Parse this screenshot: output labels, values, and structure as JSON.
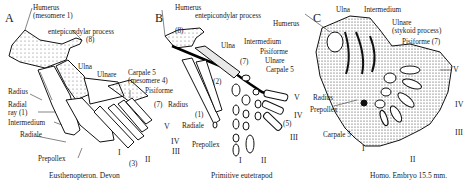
{
  "panels": [
    {
      "letter": "A",
      "caption": "Eusthenopteron. Devon",
      "labels": {
        "humerus": "Humerus",
        "humerus_sub": "(mesomere 1)",
        "entepicondylar": "entepicondylar process",
        "entepicondylar_num": "(8)",
        "ulna": "Ulna",
        "ulnare": "Ulnare",
        "carpale5": "Carpale 5",
        "carpale5_sub": "(mesomere 4)",
        "pisiforme": "Pisiforme",
        "pisiforme_num": "(7)",
        "radius": "Radius",
        "radial_ray": "Radial",
        "radial_ray2": "ray (1)",
        "intermedium": "Intermedium",
        "radiale": "Radiale",
        "prepollex": "Prepollex",
        "digits": [
          "I",
          "II",
          "III",
          "IV",
          "V"
        ],
        "num3": "(3)"
      }
    },
    {
      "letter": "B",
      "caption": "Primitive eutetrapod",
      "labels": {
        "humerus": "Humerus",
        "entepicondylar": "entepicondylar process",
        "entepicondylar_num": "(8)",
        "ulna": "Ulna",
        "intermedium": "Intermedium",
        "pisiforme": "Pisiforme",
        "pisiforme_num": "(7)",
        "ulnare": "Ulnare",
        "carpale5": "Carpale 5",
        "num2": "(2)",
        "radius": "Radius",
        "num1": "(1)",
        "radiale": "Radiale",
        "prepollex": "Prepollex",
        "num5": "(5)",
        "digits": [
          "I",
          "II",
          "III",
          "IV",
          "V"
        ]
      }
    },
    {
      "letter": "C",
      "caption": "Homo. Embryo 15.5 mm.",
      "labels": {
        "humerus": "Humerus",
        "ulna": "Ulna",
        "intermedium": "Intermedium",
        "ulnare": "Ulnare",
        "ulnare_sub": "(stykoid process)",
        "pisiforme": "Pisiforme (7)",
        "radius": "Radius",
        "prepollex": "Prepollex",
        "carpale5": "Carpale 5",
        "digits": [
          "I",
          "II",
          "III",
          "IV",
          "V"
        ]
      }
    }
  ]
}
